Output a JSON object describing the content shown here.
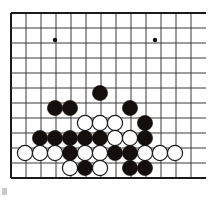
{
  "board": {
    "kind": "go-board-diagram",
    "title": "Go board position",
    "size": 19,
    "visible_columns": 13,
    "visible_rows": 12,
    "origin_x": 11,
    "origin_y": 13,
    "spacing": 15,
    "edge_top": true,
    "edge_left": true,
    "edge_bottom": true,
    "edge_right": false,
    "colors": {
      "background": "#ffffff",
      "line": "#3a3a3a",
      "edge_line": "#1a1a1a",
      "black_stone": "#140f0d",
      "white_stone": "#ffffff",
      "white_stone_outline": "#1a1a1a",
      "star_point": "#140f0d",
      "corner_mark": "#c9c9c9"
    },
    "line_width": 1,
    "edge_line_width": 2,
    "stone_radius": 7.6,
    "star_radius": 2.2,
    "star_points": [
      {
        "x": 55,
        "y": 40
      },
      {
        "x": 155,
        "y": 40
      }
    ],
    "stones": [
      {
        "color": "black",
        "x": 100,
        "y": 93
      },
      {
        "color": "black",
        "x": 55,
        "y": 108
      },
      {
        "color": "black",
        "x": 70,
        "y": 108
      },
      {
        "color": "black",
        "x": 130,
        "y": 108
      },
      {
        "color": "white",
        "x": 85,
        "y": 123
      },
      {
        "color": "white",
        "x": 100,
        "y": 123
      },
      {
        "color": "white",
        "x": 115,
        "y": 123
      },
      {
        "color": "black",
        "x": 145,
        "y": 123
      },
      {
        "color": "black",
        "x": 40,
        "y": 138
      },
      {
        "color": "black",
        "x": 55,
        "y": 138
      },
      {
        "color": "black",
        "x": 70,
        "y": 138
      },
      {
        "color": "black",
        "x": 85,
        "y": 138
      },
      {
        "color": "black",
        "x": 100,
        "y": 138
      },
      {
        "color": "white",
        "x": 115,
        "y": 138
      },
      {
        "color": "white",
        "x": 130,
        "y": 138
      },
      {
        "color": "black",
        "x": 145,
        "y": 138
      },
      {
        "color": "white",
        "x": 25,
        "y": 153
      },
      {
        "color": "white",
        "x": 40,
        "y": 153
      },
      {
        "color": "white",
        "x": 55,
        "y": 153
      },
      {
        "color": "black",
        "x": 70,
        "y": 153
      },
      {
        "color": "white",
        "x": 85,
        "y": 153
      },
      {
        "color": "white",
        "x": 100,
        "y": 153
      },
      {
        "color": "black",
        "x": 115,
        "y": 153
      },
      {
        "color": "black",
        "x": 130,
        "y": 153
      },
      {
        "color": "white",
        "x": 145,
        "y": 153
      },
      {
        "color": "white",
        "x": 160,
        "y": 153
      },
      {
        "color": "white",
        "x": 175,
        "y": 153
      },
      {
        "color": "white",
        "x": 70,
        "y": 168
      },
      {
        "color": "black",
        "x": 85,
        "y": 168
      },
      {
        "color": "white",
        "x": 100,
        "y": 168
      },
      {
        "color": "black",
        "x": 130,
        "y": 168
      },
      {
        "color": "black",
        "x": 145,
        "y": 168
      }
    ],
    "counts": {
      "black_stones": 17,
      "white_stones": 15,
      "total_stones": 32
    }
  },
  "corner_mark": {
    "label": "page-corner-mark"
  }
}
